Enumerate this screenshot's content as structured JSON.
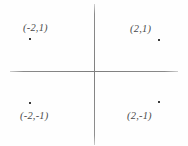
{
  "figure": {
    "background_color": "#fefefe",
    "axis_color": "#8a8a8a",
    "label_color": "#4a4a4a",
    "point_color": "#3b3b3b"
  },
  "chart_data": {
    "type": "scatter",
    "title": "",
    "xlabel": "",
    "ylabel": "",
    "grid": false,
    "legend": null,
    "axes": {
      "x_axis_visible": true,
      "y_axis_visible": true,
      "tick_labels_visible": false,
      "origin_label_visible": false,
      "xlim": [
        -5,
        5
      ],
      "ylim": [
        -4,
        4
      ]
    },
    "points": [
      {
        "label": "(-2,1)",
        "x": -2,
        "y": 1,
        "quadrant": "II",
        "label_position": "above-left-of-point"
      },
      {
        "label": "(2,1)",
        "x": 2,
        "y": 1,
        "quadrant": "I",
        "label_position": "above-left-of-point"
      },
      {
        "label": "(-2,-1)",
        "x": -2,
        "y": -1,
        "quadrant": "III",
        "label_position": "below-of-point"
      },
      {
        "label": "(2,-1)",
        "x": 2,
        "y": -1,
        "quadrant": "IV",
        "label_position": "below-left-of-point"
      }
    ]
  }
}
